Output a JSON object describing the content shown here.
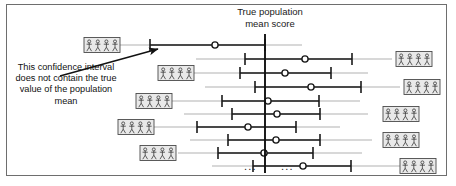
{
  "figure": {
    "title": "True population mean score",
    "title_line1": "True population",
    "title_line2": "mean score",
    "annotation": "This confidence interval does not contain the true value of the population mean",
    "ellipsis_left": "...",
    "ellipsis_right": "...",
    "background_color": "#ffffff",
    "border_color": "#6e6e6e",
    "line_color": "#1a1a1a",
    "icon_fill": "#e9e9e9",
    "icon_border": "#4a4a4a"
  },
  "chart_data": {
    "type": "scatter",
    "title": "True population mean score",
    "xlabel": "",
    "ylabel": "",
    "grid": false,
    "legend": false,
    "annotations": [
      {
        "text": "This confidence interval does not contain the true value of the population mean",
        "points_to_row": 1
      }
    ],
    "reference_line": {
      "name": "True population mean score",
      "x": 265,
      "orientation": "vertical"
    },
    "x_axis_note": "positions given in pixel coordinates of the original figure",
    "samples": [
      {
        "row": 1,
        "y": 45,
        "line_start": 114,
        "line_end": 302,
        "ci_low": 150,
        "ci_high": 265,
        "mean": 215,
        "contains_true_mean": false,
        "icon_side": "left",
        "icon_x": 84
      },
      {
        "row": 2,
        "y": 59,
        "line_start": 196,
        "line_end": 392,
        "ci_low": 245,
        "ci_high": 352,
        "mean": 305,
        "contains_true_mean": true,
        "icon_side": "right",
        "icon_x": 396
      },
      {
        "row": 3,
        "y": 73,
        "line_start": 186,
        "line_end": 368,
        "ci_low": 240,
        "ci_high": 331,
        "mean": 285,
        "contains_true_mean": true,
        "icon_side": "left",
        "icon_x": 158
      },
      {
        "row": 4,
        "y": 87,
        "line_start": 205,
        "line_end": 400,
        "ci_low": 255,
        "ci_high": 361,
        "mean": 311,
        "contains_true_mean": true,
        "icon_side": "right",
        "icon_x": 404
      },
      {
        "row": 5,
        "y": 101,
        "line_start": 172,
        "line_end": 360,
        "ci_low": 222,
        "ci_high": 319,
        "mean": 268,
        "contains_true_mean": true,
        "icon_side": "left",
        "icon_x": 136
      },
      {
        "row": 6,
        "y": 114,
        "line_start": 184,
        "line_end": 368,
        "ci_low": 232,
        "ci_high": 320,
        "mean": 277,
        "contains_true_mean": true,
        "icon_side": "right",
        "icon_x": 383
      },
      {
        "row": 7,
        "y": 127,
        "line_start": 148,
        "line_end": 340,
        "ci_low": 197,
        "ci_high": 296,
        "mean": 248,
        "contains_true_mean": true,
        "icon_side": "left",
        "icon_x": 118
      },
      {
        "row": 8,
        "y": 140,
        "line_start": 190,
        "line_end": 372,
        "ci_low": 228,
        "ci_high": 320,
        "mean": 276,
        "contains_true_mean": true,
        "icon_side": "right",
        "icon_x": 383
      },
      {
        "row": 9,
        "y": 153,
        "line_start": 178,
        "line_end": 362,
        "ci_low": 218,
        "ci_high": 313,
        "mean": 264,
        "contains_true_mean": true,
        "icon_side": "left",
        "icon_x": 140
      },
      {
        "row": 10,
        "y": 166,
        "line_start": 212,
        "line_end": 400,
        "ci_low": 253,
        "ci_high": 351,
        "mean": 303,
        "contains_true_mean": true,
        "icon_side": "right",
        "icon_x": 400
      }
    ]
  },
  "icons": {
    "sample_group_label": "sample-group-icon",
    "figures_per_box": 4
  }
}
